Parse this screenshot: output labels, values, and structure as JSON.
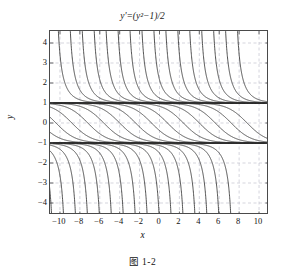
{
  "figure": {
    "title": "y'=(y²−1)/2",
    "title_parts": {
      "lhs": "y'",
      "eq": "=",
      "rhs": "(y²−1)/2"
    },
    "caption": "图 1-2",
    "xlabel": "x",
    "ylabel": "y"
  },
  "chart_data": {
    "type": "line",
    "title": "y'=(y²−1)/2",
    "subtitle": "",
    "xlabel": "x",
    "ylabel": "y",
    "xlim": [
      -11,
      11
    ],
    "ylim": [
      -4.6,
      4.6
    ],
    "xticks": [
      -10,
      -8,
      -6,
      -4,
      -2,
      0,
      2,
      4,
      6,
      8,
      10
    ],
    "yticks": [
      -4,
      -3,
      -2,
      -1,
      0,
      1,
      2,
      3,
      4
    ],
    "xtick_labels": [
      "−10",
      "−8",
      "−6",
      "−4",
      "−2",
      "0",
      "2",
      "4",
      "6",
      "8",
      "10"
    ],
    "ytick_labels": [
      "−4",
      "−3",
      "−2",
      "−1",
      "0",
      "1",
      "2",
      "3",
      "4"
    ],
    "grid": true,
    "grid_style": "dashed",
    "grid_color": "#b9b9c6",
    "legend": null,
    "curve_color": "#333333",
    "equilibrium_color": "#3b3b3b",
    "frame_color": "#4a4a4a",
    "equilibria": [
      1,
      -1
    ],
    "ode": "y' = (y^2 - 1)/2",
    "solution_form": "y(x) = (1 + C*exp(x)) / (1 - C*exp(x))  family of solutions asymptotic to y=1 and y=-1",
    "branch_shifts_upper": [
      -10.6,
      -9.4,
      -8.2,
      -7.0,
      -5.8,
      -4.6,
      -3.4,
      -2.2,
      -1.0,
      0.2,
      1.4,
      2.6,
      3.8,
      5.0,
      6.2,
      7.4
    ],
    "branch_shifts_middle": [
      -12.0,
      -10.4,
      -8.8,
      -7.2,
      -5.6,
      -4.0,
      -2.4,
      -0.8,
      0.8,
      2.4,
      4.0,
      5.6,
      7.2,
      8.8
    ],
    "branch_shifts_lower": [
      -10.4,
      -9.2,
      -8.0,
      -6.8,
      -5.6,
      -4.4,
      -3.2,
      -2.0,
      -0.8,
      0.4,
      1.6,
      2.8,
      4.0,
      5.2,
      6.4,
      7.6
    ]
  }
}
